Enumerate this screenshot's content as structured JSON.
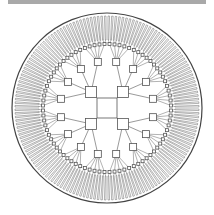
{
  "diagram": {
    "type": "radial-tree",
    "center": [
      107,
      108
    ],
    "colors": {
      "line": "#555555",
      "box_fill": "#ffffff",
      "box_stroke": "#555555",
      "ring": "#444444",
      "top_bar": "#a9a9a9"
    },
    "root": {
      "size": 20
    },
    "level1": {
      "count": 4,
      "radius": 16,
      "size": 11,
      "angles_deg": [
        225,
        315,
        45,
        135
      ]
    },
    "level2": {
      "count": 16,
      "radius": 47,
      "size": 7
    },
    "level3": {
      "per_parent": 5,
      "radius": 64,
      "size": 3
    },
    "level4": {
      "per_parent": 2,
      "inner_radius": 68,
      "outer_radius": 92
    },
    "outer_ring": {
      "radius": 95
    }
  }
}
